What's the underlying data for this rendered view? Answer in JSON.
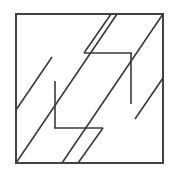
{
  "figure": {
    "title": "Diagonal band square puzzle figure",
    "type": "line-diagram",
    "canvas": {
      "width": 178,
      "height": 176,
      "background": "#ffffff"
    },
    "stroke_color": "#3a3a3c",
    "outer_square": {
      "name": "outer-square",
      "x": 16,
      "y": 14,
      "width": 147,
      "height": 149
    },
    "inner_square": {
      "name": "inner-square",
      "x": 55,
      "y": 53,
      "width": 76,
      "height": 75,
      "segments": [
        {
          "name": "inner-top-edge",
          "x1": 84,
          "y1": 53,
          "x2": 131,
          "y2": 53
        },
        {
          "name": "inner-right-edge",
          "x1": 131,
          "y1": 53,
          "x2": 131,
          "y2": 103
        },
        {
          "name": "inner-left-edge",
          "x1": 55,
          "y1": 82,
          "x2": 55,
          "y2": 128
        },
        {
          "name": "inner-bottom-edge",
          "x1": 55,
          "y1": 128,
          "x2": 103,
          "y2": 128
        }
      ]
    },
    "diagonals": [
      {
        "name": "diagonal-lower-band-lower-edge",
        "x1": 16,
        "y1": 163,
        "x2": 117,
        "y2": 14
      },
      {
        "name": "diagonal-lower-band-upper-edge",
        "x1": 16,
        "y1": 110,
        "x2": 55,
        "y2": 53
      },
      {
        "name": "diagonal-mid-band-segment-a",
        "x1": 84,
        "y1": 53,
        "x2": 163,
        "y2": 78
      },
      {
        "name": "diagonal-upper-band-edge",
        "x1": 163,
        "y1": 14,
        "x2": 103,
        "y2": 128
      },
      {
        "name": "diagonal-band-lower-left",
        "x1": 55,
        "y1": 128,
        "x2": 16,
        "y2": 163
      },
      {
        "name": "diagonal-band-tail",
        "x1": 163,
        "y1": 78,
        "x2": 131,
        "y2": 103
      }
    ],
    "line_count": 10
  }
}
